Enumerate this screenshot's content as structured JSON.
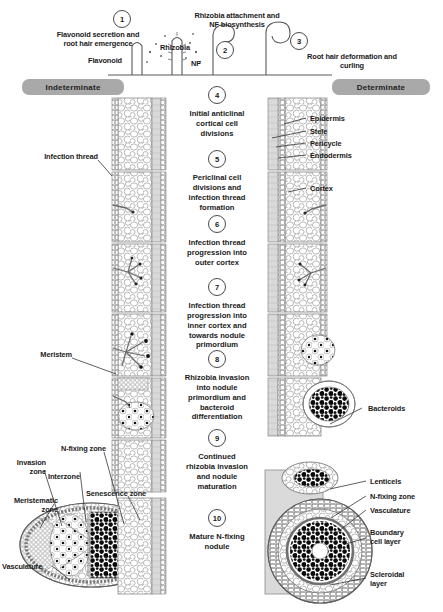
{
  "figure": {
    "background": "#ffffff",
    "ink": "#1a1a1a",
    "badge_color": "#a9a9a9",
    "bacteroid_color": "#000000",
    "cell_outline": "#8a8a8a"
  },
  "headers": [
    {
      "label": "Indeterminate",
      "side": "left"
    },
    {
      "label": "Determinate",
      "side": "right"
    }
  ],
  "top_annotations": [
    {
      "label": "Flavonoid secretion and\nroot hair emergence"
    },
    {
      "label": "Rhizobia attachment and\nNF biosynthesis"
    },
    {
      "label": "Root hair deformation and\ncurling"
    },
    {
      "label": "Flavonoid"
    },
    {
      "label": "Rhizobia"
    },
    {
      "label": "NF"
    }
  ],
  "steps": [
    {
      "number": "1",
      "text": "Flavonoid secretion and\nroot hair emergence"
    },
    {
      "number": "2",
      "text": "Rhizobia attachment and\nNF biosynthesis"
    },
    {
      "number": "3",
      "text": "Root hair deformation and\ncurling"
    },
    {
      "number": "4",
      "text": "Initial anticlinal\ncortical cell\ndivisions"
    },
    {
      "number": "5",
      "text": "Periclinal cell\ndivisions and\ninfection thread\nformation"
    },
    {
      "number": "6",
      "text": "Infection thread\nprogression into\nouter cortex"
    },
    {
      "number": "7",
      "text": "Infection thread\nprogression into\ninner cortex and\ntowards nodule\nprimordium"
    },
    {
      "number": "8",
      "text": "Rhizobia invasion\ninto nodule\nprimordium and\nbacteroid\ndifferentiation"
    },
    {
      "number": "9",
      "text": "Continued\nrhizobia invasion\nand nodule\nmaturation"
    },
    {
      "number": "10",
      "text": "Mature N-fixing\nnodule"
    }
  ],
  "left_labels": [
    {
      "label": "Infection thread"
    },
    {
      "label": "Meristem"
    },
    {
      "label": "N-fixing zone"
    },
    {
      "label": "Invasion\nzone"
    },
    {
      "label": "Interzone"
    },
    {
      "label": "Senescence zone"
    },
    {
      "label": "Meristematic\nzone"
    },
    {
      "label": "Vasculature"
    }
  ],
  "right_labels": [
    {
      "label": "Epidermis"
    },
    {
      "label": "Stele"
    },
    {
      "label": "Pericycle"
    },
    {
      "label": "Endodermis"
    },
    {
      "label": "Cortex"
    },
    {
      "label": "Bacteroids"
    },
    {
      "label": "Lenticels"
    },
    {
      "label": "N-fixing zone"
    },
    {
      "label": "Vasculature"
    },
    {
      "label": "Boundary\ncell layer"
    },
    {
      "label": "Scleroidal\nlayer"
    }
  ]
}
